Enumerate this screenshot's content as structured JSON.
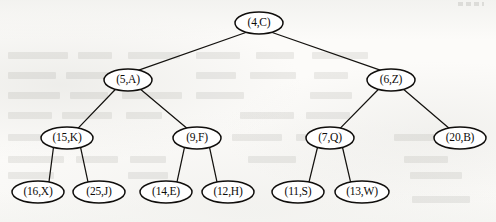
{
  "figure": {
    "kind": "binary-tree-diagram",
    "background_color": "#fcfbf9",
    "stroke_color": "#14120f",
    "node_fill_color": "#ffffff",
    "width": 496,
    "height": 222
  },
  "tree": {
    "root_id": "n0",
    "levels": [
      [
        "n0"
      ],
      [
        "n1",
        "n2"
      ],
      [
        "n3",
        "n4",
        "n5",
        "n6"
      ],
      [
        "n7",
        "n8",
        "n9",
        "n10",
        "n11",
        "n12"
      ]
    ],
    "nodes": [
      {
        "id": "n0",
        "label": "(4,C)",
        "key": 4,
        "value": "C",
        "cx": 259,
        "cy": 23,
        "rx": 24,
        "ry": 11,
        "level": 0,
        "parent": null
      },
      {
        "id": "n1",
        "label": "(5,A)",
        "key": 5,
        "value": "A",
        "cx": 128,
        "cy": 80,
        "rx": 24,
        "ry": 11,
        "level": 1,
        "parent": "n0"
      },
      {
        "id": "n2",
        "label": "(6,Z)",
        "key": 6,
        "value": "Z",
        "cx": 391,
        "cy": 80,
        "rx": 24,
        "ry": 11,
        "level": 1,
        "parent": "n0"
      },
      {
        "id": "n3",
        "label": "(15,K)",
        "key": 15,
        "value": "K",
        "cx": 67,
        "cy": 138,
        "rx": 26,
        "ry": 11,
        "level": 2,
        "parent": "n1"
      },
      {
        "id": "n4",
        "label": "(9,F)",
        "key": 9,
        "value": "F",
        "cx": 197,
        "cy": 138,
        "rx": 24,
        "ry": 11,
        "level": 2,
        "parent": "n1"
      },
      {
        "id": "n5",
        "label": "(7,Q)",
        "key": 7,
        "value": "Q",
        "cx": 330,
        "cy": 138,
        "rx": 24,
        "ry": 11,
        "level": 2,
        "parent": "n2"
      },
      {
        "id": "n6",
        "label": "(20,B)",
        "key": 20,
        "value": "B",
        "cx": 460,
        "cy": 138,
        "rx": 26,
        "ry": 11,
        "level": 2,
        "parent": "n2"
      },
      {
        "id": "n7",
        "label": "(16,X)",
        "key": 16,
        "value": "X",
        "cx": 38,
        "cy": 192,
        "rx": 26,
        "ry": 11,
        "level": 3,
        "parent": "n3"
      },
      {
        "id": "n8",
        "label": "(25,J)",
        "key": 25,
        "value": "J",
        "cx": 99,
        "cy": 192,
        "rx": 26,
        "ry": 11,
        "level": 3,
        "parent": "n3"
      },
      {
        "id": "n9",
        "label": "(14,E)",
        "key": 14,
        "value": "E",
        "cx": 166,
        "cy": 192,
        "rx": 26,
        "ry": 11,
        "level": 3,
        "parent": "n4"
      },
      {
        "id": "n10",
        "label": "(12,H)",
        "key": 12,
        "value": "H",
        "cx": 228,
        "cy": 192,
        "rx": 26,
        "ry": 11,
        "level": 3,
        "parent": "n4"
      },
      {
        "id": "n11",
        "label": "(11,S)",
        "key": 11,
        "value": "S",
        "cx": 298,
        "cy": 192,
        "rx": 26,
        "ry": 11,
        "level": 3,
        "parent": "n5"
      },
      {
        "id": "n12",
        "label": "(13,W)",
        "key": 13,
        "value": "W",
        "cx": 362,
        "cy": 192,
        "rx": 27,
        "ry": 11,
        "level": 3,
        "parent": "n5"
      }
    ],
    "edges": [
      {
        "id": "e0",
        "from": "n0",
        "to": "n1",
        "side": "left"
      },
      {
        "id": "e1",
        "from": "n0",
        "to": "n2",
        "side": "right"
      },
      {
        "id": "e2",
        "from": "n1",
        "to": "n3",
        "side": "left"
      },
      {
        "id": "e3",
        "from": "n1",
        "to": "n4",
        "side": "right"
      },
      {
        "id": "e4",
        "from": "n2",
        "to": "n5",
        "side": "left"
      },
      {
        "id": "e5",
        "from": "n2",
        "to": "n6",
        "side": "right"
      },
      {
        "id": "e6",
        "from": "n3",
        "to": "n7",
        "side": "left"
      },
      {
        "id": "e7",
        "from": "n3",
        "to": "n8",
        "side": "right"
      },
      {
        "id": "e8",
        "from": "n4",
        "to": "n9",
        "side": "left"
      },
      {
        "id": "e9",
        "from": "n4",
        "to": "n10",
        "side": "right"
      },
      {
        "id": "e10",
        "from": "n5",
        "to": "n11",
        "side": "left"
      },
      {
        "id": "e11",
        "from": "n5",
        "to": "n12",
        "side": "right"
      }
    ]
  },
  "ghost_text_lines": [
    {
      "x": 8,
      "y": 52,
      "w": 60
    },
    {
      "x": 78,
      "y": 52,
      "w": 34
    },
    {
      "x": 128,
      "y": 52,
      "w": 52
    },
    {
      "x": 196,
      "y": 52,
      "w": 44
    },
    {
      "x": 256,
      "y": 52,
      "w": 38
    },
    {
      "x": 312,
      "y": 52,
      "w": 56
    },
    {
      "x": 8,
      "y": 72,
      "w": 48
    },
    {
      "x": 66,
      "y": 72,
      "w": 56
    },
    {
      "x": 196,
      "y": 72,
      "w": 40
    },
    {
      "x": 250,
      "y": 72,
      "w": 46
    },
    {
      "x": 314,
      "y": 72,
      "w": 34
    },
    {
      "x": 8,
      "y": 92,
      "w": 52
    },
    {
      "x": 70,
      "y": 92,
      "w": 38
    },
    {
      "x": 122,
      "y": 92,
      "w": 60
    },
    {
      "x": 196,
      "y": 92,
      "w": 48
    },
    {
      "x": 310,
      "y": 92,
      "w": 42
    },
    {
      "x": 8,
      "y": 112,
      "w": 44
    },
    {
      "x": 62,
      "y": 112,
      "w": 50
    },
    {
      "x": 126,
      "y": 112,
      "w": 36
    },
    {
      "x": 240,
      "y": 112,
      "w": 54
    },
    {
      "x": 306,
      "y": 112,
      "w": 44
    },
    {
      "x": 8,
      "y": 134,
      "w": 40
    },
    {
      "x": 232,
      "y": 134,
      "w": 50
    },
    {
      "x": 296,
      "y": 134,
      "w": 38
    },
    {
      "x": 394,
      "y": 134,
      "w": 46
    },
    {
      "x": 8,
      "y": 156,
      "w": 56
    },
    {
      "x": 76,
      "y": 156,
      "w": 42
    },
    {
      "x": 130,
      "y": 156,
      "w": 36
    },
    {
      "x": 248,
      "y": 156,
      "w": 48
    },
    {
      "x": 404,
      "y": 156,
      "w": 44
    },
    {
      "x": 8,
      "y": 172,
      "w": 46
    },
    {
      "x": 128,
      "y": 172,
      "w": 40
    },
    {
      "x": 410,
      "y": 172,
      "w": 52
    },
    {
      "x": 412,
      "y": 196,
      "w": 58
    }
  ]
}
